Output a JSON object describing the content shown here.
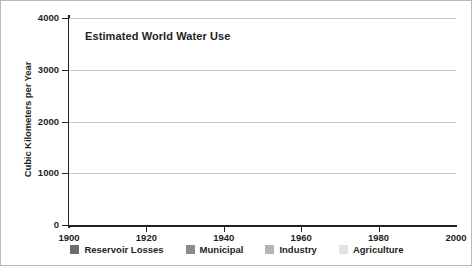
{
  "chart_data": {
    "type": "area",
    "stacked": true,
    "title": "Estimated World Water Use",
    "xlabel": "",
    "ylabel": "Cubic Kilometers per Year",
    "xlim": [
      1900,
      2000
    ],
    "ylim": [
      0,
      4000
    ],
    "grid": true,
    "legend_position": "bottom",
    "x": [
      1900,
      1920,
      1940,
      1960,
      1980,
      2000
    ],
    "xticks": [
      "1900",
      "1920",
      "1940",
      "1960",
      "1980",
      "2000"
    ],
    "yticks": [
      "0",
      "1000",
      "2000",
      "3000",
      "4000"
    ],
    "ytick_values": [
      0,
      1000,
      2000,
      3000,
      4000
    ],
    "series": [
      {
        "name": "Agriculture",
        "color": "#e2e2e0",
        "values": [
          400,
          550,
          800,
          1500,
          2200,
          2600
        ]
      },
      {
        "name": "Industry",
        "color": "#b5b5b3",
        "values": [
          50,
          80,
          90,
          250,
          550,
          800
        ]
      },
      {
        "name": "Municipal",
        "color": "#8c8c8a",
        "values": [
          40,
          60,
          70,
          130,
          220,
          320
        ]
      },
      {
        "name": "Reservoir Losses",
        "color": "#6d6d6b",
        "values": [
          80,
          110,
          140,
          170,
          180,
          180
        ]
      }
    ],
    "totals": [
      570,
      800,
      1100,
      2050,
      3150,
      3900
    ],
    "annotations": []
  },
  "legend": {
    "items": [
      {
        "label": "Reservoir Losses",
        "color": "#6d6d6b"
      },
      {
        "label": "Municipal",
        "color": "#8c8c8a"
      },
      {
        "label": "Industry",
        "color": "#b5b5b3"
      },
      {
        "label": "Agriculture",
        "color": "#e2e2e0"
      }
    ]
  },
  "axis": {
    "y_title": "Cubic Kilometers per Year"
  }
}
